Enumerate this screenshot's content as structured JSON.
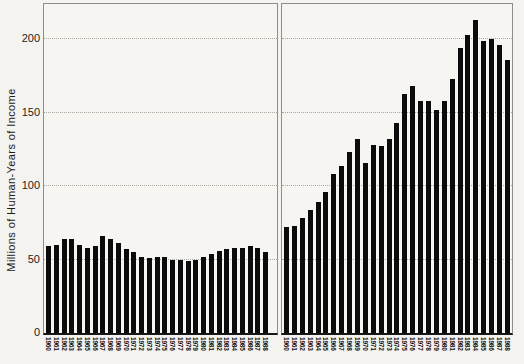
{
  "figure": {
    "background": "#f4f3f0"
  },
  "chart_data": {
    "type": "bar",
    "title": "",
    "xlabel": "",
    "ylabel": "Millions of Human-Years of Income",
    "ylim": [
      0,
      224
    ],
    "yticks": [
      0,
      50,
      100,
      150,
      200
    ],
    "grid": "horizontal dotted lines at each y tick",
    "legend": "none",
    "bar_color": "#0b0b0b",
    "layout": "two side-by-side panels sharing one y axis",
    "categories": [
      "1960",
      "1961",
      "1962",
      "1963",
      "1964",
      "1965",
      "1966",
      "1967",
      "1968",
      "1969",
      "1970",
      "1971",
      "1972",
      "1973",
      "1974",
      "1975",
      "1976",
      "1977",
      "1978",
      "1979",
      "1980",
      "1981",
      "1982",
      "1983",
      "1984",
      "1985",
      "1986",
      "1987",
      "1988"
    ],
    "panels": [
      {
        "name": "left",
        "values": [
          59,
          60,
          64,
          64,
          60,
          58,
          59,
          66,
          64,
          61,
          57,
          55,
          52,
          51,
          52,
          52,
          50,
          50,
          49,
          50,
          52,
          54,
          56,
          57,
          58,
          58,
          59,
          58,
          55
        ]
      },
      {
        "name": "right",
        "values": [
          72,
          73,
          78,
          84,
          89,
          96,
          108,
          114,
          123,
          132,
          116,
          128,
          127,
          132,
          143,
          163,
          168,
          158,
          158,
          152,
          158,
          173,
          194,
          203,
          213,
          199,
          200,
          196,
          186
        ]
      }
    ]
  }
}
